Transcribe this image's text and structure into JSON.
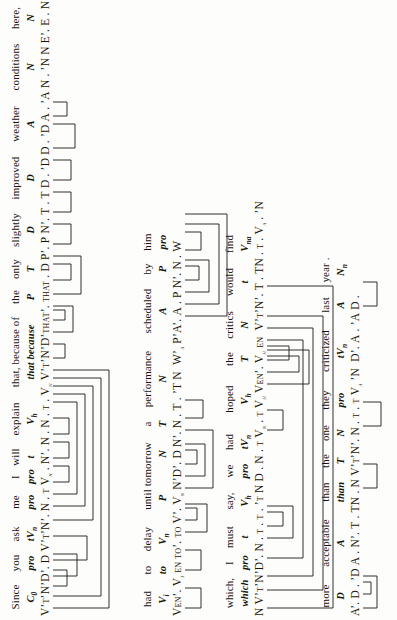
{
  "document": {
    "kind": "linguistic-constituent-diagram",
    "orientation": "rotated-90-ccw",
    "page_background": "#fdfdfb",
    "ink_color": "#16130f"
  },
  "sentences": [
    {
      "id": "sentence-1",
      "words": [
        "Since",
        "you",
        "ask",
        "me",
        "I",
        "will",
        "explain",
        "that, because of",
        "the",
        "only",
        "slightly",
        "improved",
        "weather",
        "conditions",
        "here,",
        "we",
        "have"
      ],
      "gloss": [
        "C₀",
        "pro",
        "tVₙ",
        "pro",
        "pro",
        "t",
        "Vₕ",
        "that because",
        "P",
        "T",
        "D",
        "D",
        "A",
        "N",
        "N",
        "E",
        "pro",
        "tVₙ"
      ],
      "codes": [
        "Vʹ",
        "tʹ",
        "Nʹ",
        "Dʹ",
        ".",
        "D",
        "Vʹ",
        "tʹ",
        "Nʹ",
        ".",
        "N",
        ".",
        "t",
        "Vₙ",
        ".",
        "Nʹ",
        ".",
        "N",
        ".",
        "N",
        ".",
        "t",
        ".",
        "Vₕ",
        "Vʹ",
        "tʹ",
        "Nʹ",
        "Dʹ",
        "thatʹ",
        ".",
        "that",
        ".",
        "D",
        "Pʹ",
        ".",
        "P",
        "Nʹ",
        ".",
        "T",
        ".",
        "T",
        "D",
        ".",
        "ʹD",
        "D",
        ".",
        "ʹD",
        "A",
        ".",
        "ʹA",
        "N",
        ".",
        "ʹN",
        "N",
        "Eʹ",
        ".",
        "E",
        ".",
        "N",
        ".",
        "t",
        "Vₙ"
      ],
      "note": "Since you ask me I will explain that, because of the only slightly improved weather conditions here, we have"
    },
    {
      "id": "sentence-2",
      "words": [
        "had",
        "to",
        "delay",
        "until tomorrow",
        "a",
        "performance",
        "scheduled",
        "by",
        "him"
      ],
      "gloss": [
        "Vᵢ",
        "to",
        "Vₙ",
        "P",
        "N",
        "T",
        "N",
        "A",
        "P",
        "pro"
      ],
      "codes": [
        "Venʹ",
        ".",
        "Vᵢ",
        "en",
        "toʹ",
        ".",
        "to",
        "Vʹ",
        ".",
        "Vₙ",
        "Nʹ",
        "Dʹ",
        ".",
        "D",
        "Nʹ",
        ".",
        "N",
        ".",
        "T",
        ".",
        "ʹT",
        "N",
        "Wʹₐ",
        "Pʹ",
        "Aʹ",
        ".",
        "A",
        ".",
        "P",
        "Nʹ",
        ".",
        "N",
        ".",
        "W"
      ],
      "note": "had to delay until tomorrow a performance scheduled by him"
    },
    {
      "id": "sentence-3",
      "words": [
        "which,",
        "I",
        "must",
        "say,",
        "we",
        "had",
        "hoped",
        "the",
        "critics",
        "would",
        "find"
      ],
      "gloss": [
        "which",
        "pro",
        "t",
        "Vₕ",
        "pro",
        "tVₙ",
        "Vₕ",
        "T",
        "N",
        "t",
        "Vₙₐ"
      ],
      "codes": [
        "N",
        "Vʹ",
        "tʹ",
        "Nʹ",
        "Dʹ",
        ".",
        "N",
        ".",
        "t",
        ".",
        "t",
        ".",
        "ʹt",
        "N",
        "D",
        ".",
        "N",
        ".",
        "t",
        "Vₙ",
        ".",
        "t",
        "Vₕ",
        "Venʹ",
        ".",
        "Vₕ",
        "en",
        "Vʹ",
        "tʹ",
        "Nʹ",
        ".",
        "N",
        ".",
        "t",
        ".",
        "T",
        ".",
        "T",
        "N",
        ".",
        "T",
        ".",
        "N",
        ".",
        "t",
        ".",
        "t",
        ".",
        "Vₙ",
        ".",
        "Vₐ",
        ".",
        "ʹN"
      ],
      "note": "which, I must say, we had hoped the critics would find"
    },
    {
      "id": "sentence-4",
      "words": [
        "more",
        "acceptable",
        "than",
        "the",
        "one",
        "they",
        "criticized",
        "last",
        "year ."
      ],
      "gloss": [
        "D",
        "A",
        "than",
        "T",
        "N",
        "pro",
        "tVₙ",
        "A",
        "Nₙ"
      ],
      "codes": [
        "Aʹ",
        ".",
        "D",
        ".",
        "ʹD",
        "A",
        ".",
        "Nʹ",
        ".",
        "T",
        ".",
        "T",
        "N",
        ".",
        "N",
        "Vʹ",
        "tʹ",
        "Nʹ",
        ".",
        "N",
        ".",
        "t",
        ".",
        "t",
        "Vₐ",
        "ʹN",
        "Dʹ",
        ".",
        "A",
        ".",
        "ʹA",
        "D",
        "."
      ],
      "note": "more acceptable than the one they criticized last year ."
    }
  ],
  "legend": {
    "symbols": [
      "C₀",
      "pro",
      "t",
      "V",
      "N",
      "D",
      "T",
      "A",
      "P",
      "E",
      "W",
      "en",
      "to",
      "that",
      "than",
      "which"
    ],
    "caption": ""
  }
}
